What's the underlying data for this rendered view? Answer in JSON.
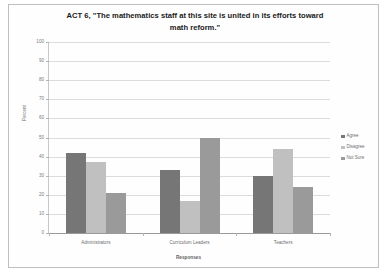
{
  "figure": {
    "background_color": "#fefefe",
    "border_color": "#bfbfbf"
  },
  "chart_data": {
    "type": "bar",
    "title": "ACT 6, \"The mathematics staff at this site is united in its efforts toward math reform.\"",
    "title_line1": "ACT 6, \"The mathematics staff at this site is united in its efforts toward",
    "title_line2": "math reform.\"",
    "xlabel": "Responses",
    "ylabel": "Percent",
    "categories": [
      "Administrators",
      "Curriculum Leaders",
      "Teachers"
    ],
    "series": [
      {
        "name": "Agree",
        "color": "#767676",
        "values": [
          42,
          33,
          30
        ]
      },
      {
        "name": "Disagree",
        "color": "#c0c0c0",
        "values": [
          37,
          17,
          44
        ]
      },
      {
        "name": "Not Sure",
        "color": "#9a9a9a",
        "values": [
          21,
          50,
          24
        ]
      }
    ],
    "ylim": [
      0,
      100
    ],
    "ytick_step": 10,
    "yticks": [
      0,
      10,
      20,
      30,
      40,
      50,
      60,
      70,
      80,
      90,
      100
    ],
    "ytick_labels": [
      "0",
      "10",
      "20",
      "30",
      "40",
      "50",
      "60",
      "70",
      "80",
      "90",
      "100"
    ],
    "grid": true,
    "grid_axis": "y",
    "legend_position": "right",
    "legend_entries": [
      "Agree",
      "Disagree",
      "Not Sure"
    ]
  }
}
